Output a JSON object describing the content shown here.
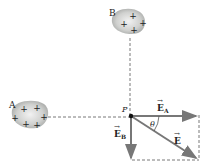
{
  "diagram": {
    "charges": [
      {
        "label": "A",
        "sign": "+",
        "count": 7
      },
      {
        "label": "B",
        "sign": "+",
        "count": 4
      }
    ],
    "point_label": "P",
    "vectors": [
      {
        "label": "E",
        "subscript": "A",
        "direction": "right"
      },
      {
        "label": "E",
        "subscript": "B",
        "direction": "down"
      },
      {
        "label": "E",
        "subscript": "",
        "direction": "diagonal (resultant)"
      }
    ],
    "angle_label": "θ",
    "colors": {
      "vector": "#777777",
      "blob": "#a8aaa8",
      "dashed": "#555555"
    }
  }
}
